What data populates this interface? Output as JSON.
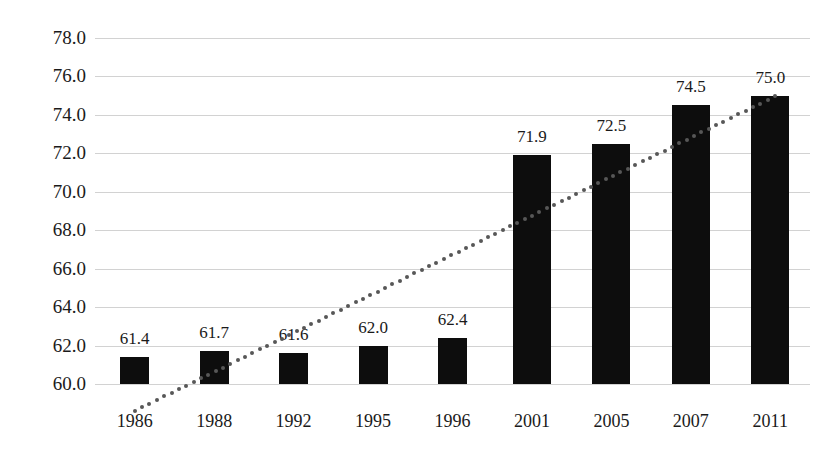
{
  "chart_data": {
    "type": "bar",
    "title": "",
    "subtitle": "",
    "xlabel": "",
    "ylabel": "",
    "categories": [
      "1986",
      "1988",
      "1992",
      "1995",
      "1996",
      "2001",
      "2005",
      "2007",
      "2011"
    ],
    "values": [
      61.4,
      61.7,
      61.6,
      62.0,
      62.4,
      71.9,
      72.5,
      74.5,
      75.0
    ],
    "value_labels": [
      "61.4",
      "61.7",
      "61.6",
      "62.0",
      "62.4",
      "71.9",
      "72.5",
      "74.5",
      "75.0"
    ],
    "ylim": [
      60.0,
      78.0
    ],
    "ytick_values": [
      60.0,
      62.0,
      64.0,
      66.0,
      68.0,
      70.0,
      72.0,
      74.0,
      76.0,
      78.0
    ],
    "ytick_labels": [
      "60.0",
      "62.0",
      "64.0",
      "66.0",
      "68.0",
      "70.0",
      "72.0",
      "74.0",
      "76.0",
      "78.0"
    ],
    "grid": true,
    "grid_color": "#d2d2d2",
    "legend": "none",
    "bar_color": "#0d0d0d",
    "series": [
      {
        "name": "values",
        "values": [
          61.4,
          61.7,
          61.6,
          62.0,
          62.4,
          71.9,
          72.5,
          74.5,
          75.0
        ]
      },
      {
        "name": "trendline",
        "type": "dotted-linear-trend",
        "color": "#575757",
        "start_value": 58.6,
        "end_value": 75.0
      }
    ]
  },
  "axis": {
    "y_min_label": "60.0",
    "y_max_label": "78.0"
  }
}
